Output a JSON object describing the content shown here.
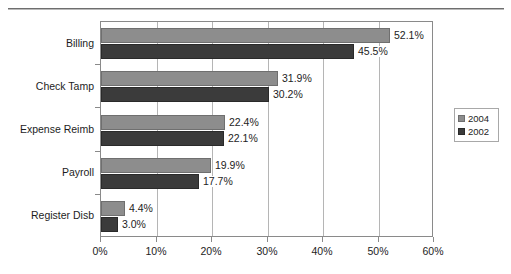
{
  "chart_data": {
    "type": "bar",
    "orientation": "horizontal",
    "title": "",
    "subtitle": "",
    "xlabel": "",
    "ylabel": "",
    "xlim": [
      0,
      60
    ],
    "xtick_labels": [
      "0%",
      "10%",
      "20%",
      "30%",
      "40%",
      "50%",
      "60%"
    ],
    "xticks": [
      0,
      10,
      20,
      30,
      40,
      50,
      60
    ],
    "grid": true,
    "legend_position": "right",
    "categories": [
      "Billing",
      "Check Tamp",
      "Expense Reimb",
      "Payroll",
      "Register Disb"
    ],
    "series": [
      {
        "name": "2004",
        "color": "#8d8d8d",
        "values": [
          52.1,
          31.9,
          22.4,
          19.9,
          4.4
        ],
        "data_labels": [
          "52.1%",
          "31.9%",
          "22.4%",
          "19.9%",
          "4.4%"
        ]
      },
      {
        "name": "2002",
        "color": "#3b3b3b",
        "values": [
          45.5,
          30.2,
          22.1,
          17.7,
          3.0
        ],
        "data_labels": [
          "45.5%",
          "30.2%",
          "22.1%",
          "17.7%",
          "3.0%"
        ]
      }
    ]
  },
  "legend": {
    "entries": [
      {
        "label": "2004",
        "color": "#8d8d8d"
      },
      {
        "label": "2002",
        "color": "#3b3b3b"
      }
    ]
  },
  "colors": {
    "series_2004": "#8d8d8d",
    "series_2002": "#3b3b3b",
    "axis": "#8a8a8a",
    "gridline": "#b5b5b5",
    "text": "#1d1d1d",
    "background": "#ffffff"
  }
}
